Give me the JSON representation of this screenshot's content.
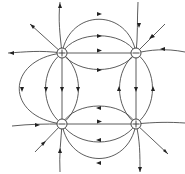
{
  "diagram": {
    "charges": [
      {
        "id": "top-left",
        "sign": "+",
        "x": 62,
        "y": 53
      },
      {
        "id": "top-right",
        "sign": "-",
        "x": 136,
        "y": 53
      },
      {
        "id": "bottom-left",
        "sign": "-",
        "x": 62,
        "y": 124
      },
      {
        "id": "bottom-right",
        "sign": "+",
        "x": 136,
        "y": 124
      }
    ],
    "colors": {
      "line": "#333333",
      "background": "#ffffff"
    }
  }
}
